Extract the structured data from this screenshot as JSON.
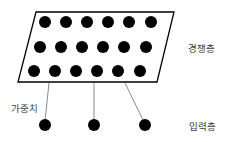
{
  "diagram": {
    "labels": {
      "competitive_layer": "경쟁층",
      "weights": "가중치",
      "input_layer": "입력층"
    },
    "competitive_layer": {
      "rows": 3,
      "cols": 6,
      "node_color": "#000000",
      "border_color": "#000000"
    },
    "input_layer": {
      "nodes": 3,
      "node_color": "#000000"
    },
    "weight_line_color": "#8a8a8a"
  }
}
